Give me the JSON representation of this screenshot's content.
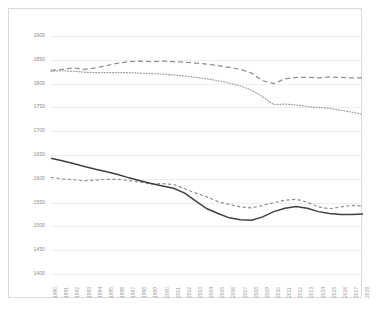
{
  "chart_data": {
    "type": "line",
    "title": "",
    "subtitle": "",
    "xlabel": "",
    "ylabel": "",
    "ylim": [
      1400,
      1900
    ],
    "ytick_step": 50,
    "yticks": [
      1900,
      1850,
      1800,
      1750,
      1700,
      1650,
      1600,
      1550,
      1500,
      1450,
      1400
    ],
    "grid": true,
    "legend": "none",
    "categories": [
      "1990",
      "1991",
      "1992",
      "1993",
      "1994",
      "1995",
      "1996",
      "1997",
      "1998",
      "1999",
      "2000",
      "2001",
      "2002",
      "2003",
      "2004",
      "2005",
      "2006",
      "2007",
      "2008",
      "2009",
      "2010",
      "2011",
      "2012",
      "2013",
      "2014",
      "2015",
      "2016",
      "2017",
      "2018"
    ],
    "series": [
      {
        "name": "upper-dashed",
        "style": "long-dashed",
        "color": "#919191",
        "values": [
          1828,
          1830,
          1833,
          1830,
          1833,
          1838,
          1843,
          1846,
          1847,
          1846,
          1847,
          1846,
          1845,
          1843,
          1841,
          1838,
          1834,
          1830,
          1822,
          1806,
          1800,
          1810,
          1813,
          1813,
          1812,
          1814,
          1813,
          1812,
          1812
        ]
      },
      {
        "name": "upper-dotted",
        "style": "dotted",
        "color": "#9d9d9d",
        "values": [
          1826,
          1827,
          1826,
          1824,
          1823,
          1823,
          1823,
          1823,
          1822,
          1821,
          1820,
          1818,
          1816,
          1813,
          1810,
          1806,
          1801,
          1795,
          1786,
          1772,
          1756,
          1757,
          1755,
          1752,
          1750,
          1748,
          1744,
          1740,
          1735
        ]
      },
      {
        "name": "lower-solid",
        "style": "solid",
        "color": "#404040",
        "values": [
          1643,
          1638,
          1632,
          1626,
          1620,
          1615,
          1609,
          1602,
          1596,
          1590,
          1585,
          1580,
          1570,
          1553,
          1537,
          1527,
          1518,
          1514,
          1513,
          1520,
          1531,
          1538,
          1542,
          1538,
          1531,
          1527,
          1525,
          1525,
          1526
        ]
      },
      {
        "name": "lower-dashed",
        "style": "short-dashed",
        "color": "#8f8f8f",
        "values": [
          1603,
          1600,
          1598,
          1596,
          1597,
          1599,
          1599,
          1596,
          1593,
          1589,
          1590,
          1588,
          1579,
          1570,
          1562,
          1552,
          1546,
          1541,
          1539,
          1544,
          1550,
          1555,
          1557,
          1551,
          1541,
          1537,
          1541,
          1544,
          1543
        ]
      }
    ]
  }
}
